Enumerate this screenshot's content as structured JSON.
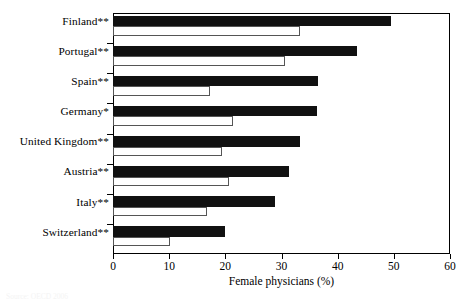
{
  "figure": {
    "top_clipped_text": "",
    "bottom_clipped_text": "Source: OECD 2006"
  },
  "axis": {
    "x_title": "Female physicians (%)",
    "tick_labels": [
      "0",
      "10",
      "20",
      "30",
      "40",
      "50",
      "60"
    ]
  },
  "series_labels": {
    "dark": "Female physicians (later year)",
    "light": "Female physicians (earlier year)"
  },
  "colors": {
    "dark_bar": "#111111",
    "light_bar_fill": "#ffffff",
    "light_bar_stroke": "#555555",
    "axis": "#000000",
    "background": "#ffffff"
  },
  "chart_data": {
    "type": "bar",
    "orientation": "horizontal",
    "title": "",
    "xlabel": "Female physicians (%)",
    "ylabel": "",
    "xlim": [
      0,
      60
    ],
    "xticks": [
      0,
      10,
      20,
      30,
      40,
      50,
      60
    ],
    "grid": false,
    "legend": "none",
    "categories": [
      "Finland**",
      "Portugal**",
      "Spain**",
      "Germany*",
      "United Kingdom**",
      "Austria**",
      "Italy**",
      "Switzerland**"
    ],
    "series": [
      {
        "name": "dark",
        "style": "filled-black",
        "values": [
          49.5,
          43.4,
          36.5,
          36.3,
          33.3,
          31.3,
          28.8,
          19.9
        ]
      },
      {
        "name": "light",
        "style": "outlined-white",
        "values": [
          33.3,
          30.6,
          17.3,
          21.4,
          19.4,
          20.7,
          16.8,
          10.2
        ]
      }
    ]
  }
}
